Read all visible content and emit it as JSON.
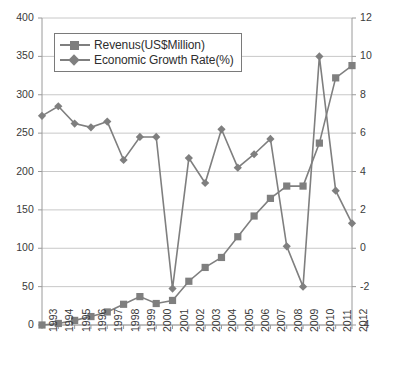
{
  "chart_data": {
    "type": "line",
    "title": "",
    "xlabel": "",
    "ylabel": "",
    "grid": true,
    "legend_position": "top-left",
    "categories": [
      "1993",
      "1994",
      "1995",
      "1996",
      "1997",
      "1998",
      "1999",
      "2000",
      "2001",
      "2002",
      "2003",
      "2004",
      "2005",
      "2006",
      "2007",
      "2008",
      "2009",
      "2010",
      "2011",
      "2012"
    ],
    "axes": {
      "left": {
        "label": "",
        "ylim": [
          0,
          400
        ],
        "ticks": [
          0,
          50,
          100,
          150,
          200,
          250,
          300,
          350,
          400
        ],
        "tick_labels": [
          "0",
          "50",
          "100",
          "150",
          "200",
          "250",
          "300",
          "350",
          "400"
        ]
      },
      "right": {
        "label": "",
        "ylim": [
          -4,
          12
        ],
        "ticks": [
          -4,
          -2,
          0,
          2,
          4,
          6,
          8,
          10,
          12
        ],
        "tick_labels": [
          "-4",
          "-2",
          "0",
          "2",
          "4",
          "6",
          "8",
          "10",
          "12"
        ]
      }
    },
    "series": [
      {
        "name": "Revenus(US$Million)",
        "axis": "left",
        "marker": "square",
        "color": "#7f7f7f",
        "values": [
          0,
          2,
          6,
          11,
          17,
          27,
          37,
          28,
          32,
          57,
          75,
          88,
          115,
          142,
          165,
          181,
          181,
          237,
          322,
          338
        ]
      },
      {
        "name": "Economic Growth Rate(%)",
        "axis": "right",
        "marker": "diamond",
        "color": "#7f7f7f",
        "values": [
          6.9,
          7.4,
          6.5,
          6.3,
          6.6,
          4.6,
          5.8,
          5.8,
          -2.1,
          4.7,
          3.4,
          6.2,
          4.2,
          4.9,
          5.7,
          0.1,
          -2.0,
          10.0,
          3.0,
          1.3
        ]
      }
    ]
  },
  "legend": {
    "items": [
      {
        "label": "Revenus(US$Million)",
        "marker": "square"
      },
      {
        "label": "Economic Growth Rate(%)",
        "marker": "diamond"
      }
    ]
  },
  "colors": {
    "series": "#7f7f7f",
    "grid": "#c8c8c8",
    "axis": "#9a9a9a",
    "text": "#3a3a3a"
  }
}
